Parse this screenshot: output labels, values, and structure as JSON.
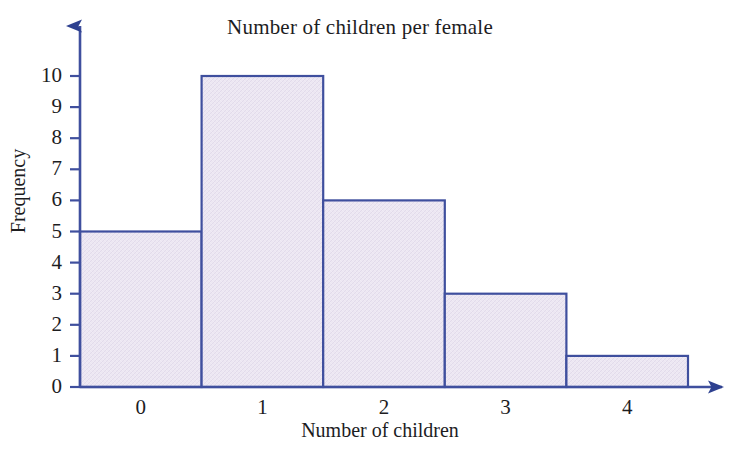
{
  "chart_data": {
    "type": "bar",
    "title": "Number of children per female",
    "xlabel": "Number of children",
    "ylabel": "Frequency",
    "categories": [
      "0",
      "1",
      "2",
      "3",
      "4"
    ],
    "values": [
      5,
      10,
      6,
      3,
      1
    ],
    "x_tick_labels": [
      "0",
      "1",
      "2",
      "3",
      "4"
    ],
    "y_tick_labels": [
      "0",
      "1",
      "2",
      "3",
      "4",
      "5",
      "6",
      "7",
      "8",
      "9",
      "10"
    ],
    "y_ticks": [
      0,
      1,
      2,
      3,
      4,
      5,
      6,
      7,
      8,
      9,
      10
    ],
    "ylim": [
      0,
      10
    ],
    "xlim": [
      -0.5,
      4.5
    ],
    "grid": false,
    "legend": null,
    "series": [
      {
        "name": "Frequency",
        "values": [
          5,
          10,
          6,
          3,
          1
        ]
      }
    ],
    "style": {
      "bar_fill": "#ece7f2",
      "bar_border": "#3f4f9e",
      "axis_color": "#3f4f9e",
      "text_color": "#1d1d1f",
      "background": "#ffffff",
      "axis_arrowheads": true,
      "bar_gap": 0
    }
  }
}
